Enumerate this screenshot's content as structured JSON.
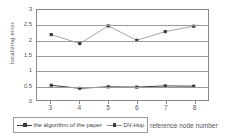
{
  "chart_data": {
    "type": "line",
    "title": "",
    "xlabel": "reference node number",
    "ylabel": "localizing error",
    "categories": [
      3,
      4,
      5,
      6,
      7,
      8
    ],
    "x": [
      3,
      4,
      5,
      6,
      7,
      8
    ],
    "xlim": [
      2.5,
      8.5
    ],
    "ylim": [
      0,
      3
    ],
    "yticks": [
      "0",
      "0.5",
      "1",
      "1.5",
      "2",
      "2.5",
      "3"
    ],
    "ytick_values": [
      0,
      0.5,
      1,
      1.5,
      2,
      2.5,
      3
    ],
    "xticks": [
      "3",
      "4",
      "5",
      "6",
      "7",
      "8"
    ],
    "grid": "horizontal",
    "legend_position": "bottom-left",
    "series": [
      {
        "name": "the algorithm of the paper",
        "values": [
          0.49,
          0.39,
          0.44,
          0.43,
          0.47,
          0.46
        ],
        "color": "#3a3a3a",
        "marker": "square"
      },
      {
        "name": "DV-Hop",
        "values": [
          2.18,
          1.88,
          2.47,
          1.99,
          2.28,
          2.46
        ],
        "color": "#9a9a9a",
        "marker": "square"
      }
    ]
  },
  "axes": {
    "y_title": "localizing error",
    "x_title": "reference node number"
  },
  "legend": {
    "items": [
      {
        "label": "the algorithm of the paper"
      },
      {
        "label": "DV-Hop"
      }
    ]
  },
  "colors": {
    "series_paper": "#3a3a3a",
    "series_dvhop": "#9a9a9a",
    "axis": "#8a8a8a",
    "grid": "#9a9a9a",
    "text": "#555555"
  }
}
